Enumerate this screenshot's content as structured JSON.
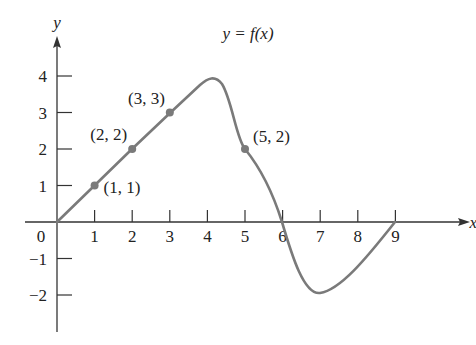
{
  "chart_data": {
    "type": "line",
    "title": "y = f(x)",
    "xlabel": "x",
    "ylabel": "y",
    "xlim": [
      0,
      9.8
    ],
    "ylim": [
      -2.9,
      5
    ],
    "grid": false,
    "x_ticks": [
      "1",
      "2",
      "3",
      "4",
      "5",
      "6",
      "7",
      "8",
      "9"
    ],
    "y_ticks": [
      "4",
      "3",
      "2",
      "1",
      "−1",
      "−2"
    ],
    "origin_label": "0",
    "curve_label": "y = f(x)",
    "series": [
      {
        "name": "f(x)",
        "x": [
          0,
          1,
          2,
          3,
          3.5,
          4,
          4.3,
          5,
          6,
          7,
          8,
          9
        ],
        "values": [
          0,
          1,
          2,
          3,
          3.5,
          3.9,
          3.6,
          2,
          0,
          -1.95,
          -1.1,
          0
        ]
      }
    ],
    "marked_points": [
      {
        "x": 1,
        "y": 1,
        "label": "(1, 1)"
      },
      {
        "x": 2,
        "y": 2,
        "label": "(2, 2)"
      },
      {
        "x": 3,
        "y": 3,
        "label": "(3, 3)"
      },
      {
        "x": 5,
        "y": 2,
        "label": "(5, 2)"
      }
    ],
    "colors": {
      "curve": "#7a7a7a",
      "axes": "#333333",
      "points": "#7a7a7a"
    }
  }
}
